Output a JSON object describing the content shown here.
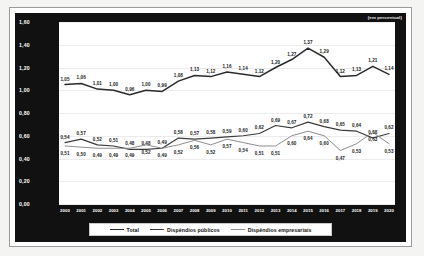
{
  "unit_note": "(em percentual)",
  "legend": {
    "items": [
      {
        "label": "Total",
        "color": "#2b2b2b",
        "width": 1.5
      },
      {
        "label": "Dispêndios públicos",
        "color": "#3a3a3a",
        "width": 1.2
      },
      {
        "label": "Dispêndios empresariais",
        "color": "#8e8e8e",
        "width": 1.0
      }
    ]
  },
  "yticks": [
    "0,00",
    "0,20",
    "0,40",
    "0,60",
    "0,80",
    "1,00",
    "1,20",
    "1,40",
    "1,60"
  ],
  "chart_data": {
    "type": "line",
    "title": "",
    "subtitle": "",
    "xlabel": "",
    "ylabel": "",
    "ylim": [
      0.0,
      1.6
    ],
    "grid": true,
    "legend_position": "bottom",
    "annotations": [
      "(em percentual)"
    ],
    "categories": [
      "2000",
      "2001",
      "2002",
      "2003",
      "2004",
      "2005",
      "2006",
      "2007",
      "2008",
      "2009",
      "2010",
      "2011",
      "2012",
      "2013",
      "2014",
      "2015",
      "2016",
      "2017",
      "2018",
      "2019",
      "2020"
    ],
    "series": [
      {
        "name": "Total",
        "color": "#2b2b2b",
        "values": [
          1.05,
          1.06,
          1.01,
          1.0,
          0.96,
          1.0,
          0.99,
          1.08,
          1.13,
          1.12,
          1.16,
          1.14,
          1.12,
          1.2,
          1.27,
          1.37,
          1.29,
          1.12,
          1.13,
          1.21,
          1.14
        ],
        "labels": [
          "1,05",
          "1,06",
          "1,01",
          "1,00",
          "0,96",
          "1,00",
          "0,99",
          "1,08",
          "1,13",
          "1,12",
          "1,16",
          "1,14",
          "1,12",
          "1,20",
          "1,27",
          "1,37",
          "1,29",
          "1,12",
          "1,13",
          "1,21",
          "1,14"
        ]
      },
      {
        "name": "Dispêndios públicos",
        "color": "#3a3a3a",
        "values": [
          0.54,
          0.57,
          0.52,
          0.51,
          0.48,
          0.48,
          0.49,
          0.58,
          0.57,
          0.58,
          0.59,
          0.6,
          0.62,
          0.69,
          0.67,
          0.72,
          0.68,
          0.65,
          0.64,
          0.58,
          0.62
        ],
        "labels": [
          "0,54",
          "0,57",
          "0,52",
          "0,51",
          "0,48",
          "0,48",
          "0,49",
          "0,58",
          "0,57",
          "0,58",
          "0,59",
          "0,60",
          "0,62",
          "0,69",
          "0,67",
          "0,72",
          "0,68",
          "0,65",
          "0,64",
          "0,58",
          "0,62"
        ]
      },
      {
        "name": "Dispêndios empresariais",
        "color": "#8e8e8e",
        "values": [
          0.51,
          0.5,
          0.49,
          0.49,
          0.49,
          0.52,
          0.49,
          0.52,
          0.56,
          0.52,
          0.57,
          0.54,
          0.51,
          0.51,
          0.6,
          0.64,
          0.6,
          0.47,
          0.53,
          0.63,
          0.53
        ],
        "labels": [
          "0,51",
          "0,50",
          "0,49",
          "0,49",
          "0,49",
          "0,52",
          "0,49",
          "0,52",
          "0,56",
          "0,52",
          "0,57",
          "0,54",
          "0,51",
          "0,51",
          "0,60",
          "0,64",
          "0,60",
          "0,47",
          "0,53",
          "0,63",
          "0,53"
        ]
      }
    ]
  }
}
